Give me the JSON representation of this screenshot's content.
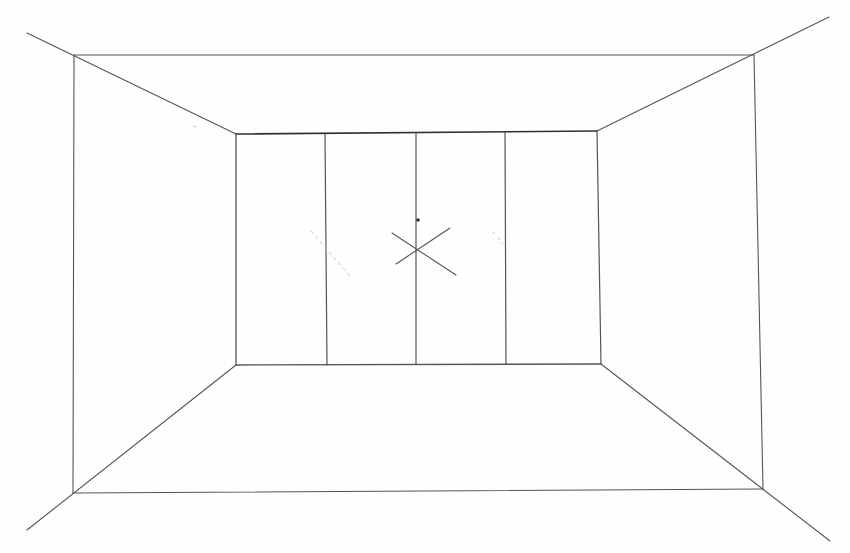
{
  "title": "One-point perspective room sketch",
  "canvas": {
    "width": 850,
    "height": 553,
    "background": "#fefefe"
  },
  "colors": {
    "stroke_dark": "#2f2f2f",
    "stroke_medium": "#555555",
    "stroke_light": "#9a9a9a",
    "stroke_faint": "#c8c8c8"
  },
  "outer_frame": {
    "top_left": [
      74,
      55
    ],
    "top_right": [
      754,
      55
    ],
    "bottom_right": [
      763,
      489
    ],
    "bottom_left": [
      73,
      493
    ]
  },
  "back_wall": {
    "top_left": [
      236,
      134
    ],
    "top_right": [
      597,
      131
    ],
    "bottom_right": [
      601,
      364
    ],
    "bottom_left": [
      236,
      365
    ]
  },
  "panel_dividers": [
    {
      "x_top": 325,
      "y_top": 134,
      "x_bottom": 327,
      "y_bottom": 365
    },
    {
      "x_top": 416,
      "y_top": 133,
      "x_bottom": 416,
      "y_bottom": 364
    },
    {
      "x_top": 505,
      "y_top": 132,
      "x_bottom": 506,
      "y_bottom": 364
    }
  ],
  "orthogonals": [
    {
      "from": [
        27,
        33
      ],
      "to": [
        236,
        134
      ]
    },
    {
      "from": [
        829,
        17
      ],
      "to": [
        597,
        131
      ]
    },
    {
      "from": [
        27,
        530
      ],
      "to": [
        236,
        365
      ]
    },
    {
      "from": [
        830,
        541
      ],
      "to": [
        601,
        364
      ]
    }
  ],
  "vanishing_point": {
    "center": [
      416,
      249
    ],
    "x_mark_lines": [
      {
        "from": [
          392,
          233
        ],
        "to": [
          456,
          275
        ]
      },
      {
        "from": [
          396,
          264
        ],
        "to": [
          450,
          228
        ]
      }
    ],
    "dot": [
      418,
      220
    ]
  },
  "faint_construction_marks": [
    {
      "from": [
        311,
        231
      ],
      "to": [
        350,
        276
      ]
    },
    {
      "from": [
        493,
        232
      ],
      "to": [
        503,
        244
      ]
    },
    {
      "from": [
        193,
        126
      ],
      "to": [
        198,
        128
      ]
    }
  ]
}
